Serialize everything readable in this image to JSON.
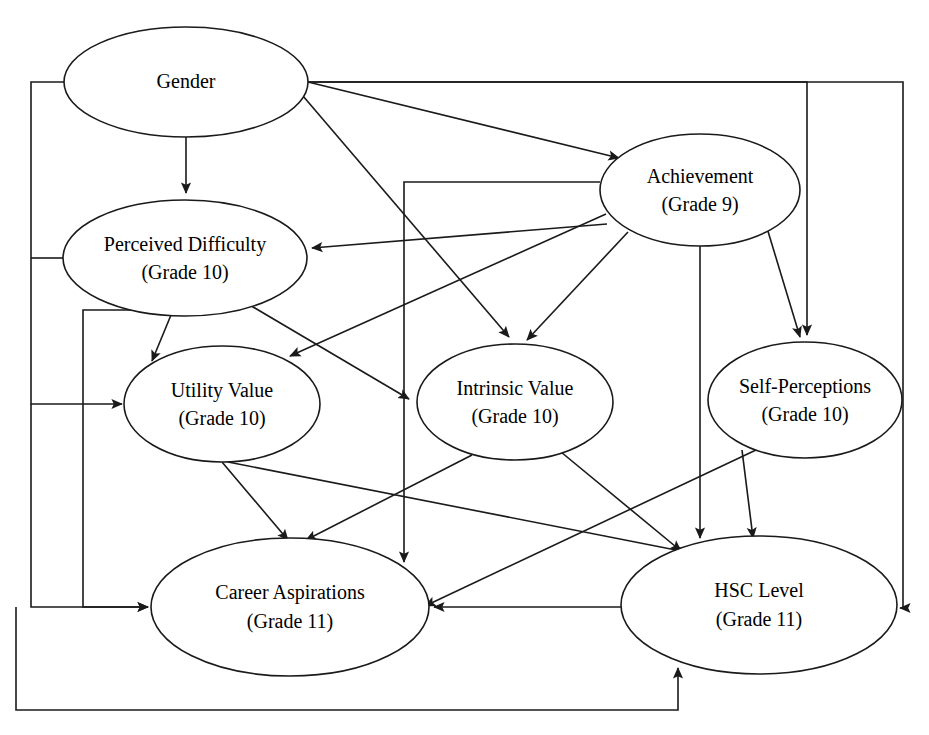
{
  "diagram": {
    "type": "path-diagram",
    "width": 929,
    "height": 735,
    "background_color": "#ffffff",
    "line_color": "#1a1a1a",
    "text_color": "#000000",
    "nodes": [
      {
        "id": "gender",
        "label": "Gender",
        "sublabel": "",
        "cx": 186,
        "cy": 82,
        "rx": 122,
        "ry": 55
      },
      {
        "id": "achievement",
        "label": "Achievement",
        "sublabel": "(Grade 9)",
        "cx": 700,
        "cy": 190,
        "rx": 100,
        "ry": 56
      },
      {
        "id": "perceived_difficulty",
        "label": "Perceived Difficulty",
        "sublabel": "(Grade 10)",
        "cx": 185,
        "cy": 258,
        "rx": 122,
        "ry": 58
      },
      {
        "id": "utility_value",
        "label": "Utility Value",
        "sublabel": "(Grade 10)",
        "cx": 222,
        "cy": 404,
        "rx": 98,
        "ry": 58
      },
      {
        "id": "intrinsic_value",
        "label": "Intrinsic Value",
        "sublabel": "(Grade 10)",
        "cx": 515,
        "cy": 402,
        "rx": 98,
        "ry": 58
      },
      {
        "id": "self_perceptions",
        "label": "Self-Perceptions",
        "sublabel": "(Grade 10)",
        "cx": 805,
        "cy": 400,
        "rx": 97,
        "ry": 58
      },
      {
        "id": "career_aspirations",
        "label": "Career Aspirations",
        "sublabel": "(Grade 11)",
        "cx": 290,
        "cy": 607,
        "rx": 139,
        "ry": 69
      },
      {
        "id": "hsc_level",
        "label": "HSC Level",
        "sublabel": "(Grade 11)",
        "cx": 759,
        "cy": 605,
        "rx": 138,
        "ry": 69
      }
    ],
    "edges": [
      {
        "id": "gender-to-achievement",
        "from": "gender",
        "to": "achievement"
      },
      {
        "id": "gender-to-perceived-difficulty",
        "from": "gender",
        "to": "perceived_difficulty"
      },
      {
        "id": "gender-to-intrinsic-value",
        "from": "gender",
        "to": "intrinsic_value"
      },
      {
        "id": "gender-to-self-perceptions",
        "from": "gender",
        "to": "self_perceptions"
      },
      {
        "id": "gender-to-hsc-level",
        "from": "gender",
        "to": "hsc_level"
      },
      {
        "id": "gender-to-utility-value",
        "from": "gender",
        "to": "utility_value"
      },
      {
        "id": "gender-to-career-aspirations",
        "from": "gender",
        "to": "career_aspirations"
      },
      {
        "id": "achievement-to-perceived-difficulty",
        "from": "achievement",
        "to": "perceived_difficulty"
      },
      {
        "id": "achievement-to-utility-value",
        "from": "achievement",
        "to": "utility_value"
      },
      {
        "id": "achievement-to-intrinsic-value",
        "from": "achievement",
        "to": "intrinsic_value"
      },
      {
        "id": "achievement-to-self-perceptions",
        "from": "achievement",
        "to": "self_perceptions"
      },
      {
        "id": "achievement-to-hsc-level",
        "from": "achievement",
        "to": "hsc_level"
      },
      {
        "id": "achievement-to-career-aspirations",
        "from": "achievement",
        "to": "career_aspirations"
      },
      {
        "id": "perceived-difficulty-to-utility-value",
        "from": "perceived_difficulty",
        "to": "utility_value"
      },
      {
        "id": "perceived-difficulty-to-intrinsic-value",
        "from": "perceived_difficulty",
        "to": "intrinsic_value"
      },
      {
        "id": "perceived-difficulty-to-career-aspirations",
        "from": "perceived_difficulty",
        "to": "career_aspirations"
      },
      {
        "id": "utility-value-to-career-aspirations",
        "from": "utility_value",
        "to": "career_aspirations"
      },
      {
        "id": "utility-value-to-hsc-level",
        "from": "utility_value",
        "to": "hsc_level"
      },
      {
        "id": "intrinsic-value-to-career-aspirations",
        "from": "intrinsic_value",
        "to": "career_aspirations"
      },
      {
        "id": "intrinsic-value-to-hsc-level",
        "from": "intrinsic_value",
        "to": "hsc_level"
      },
      {
        "id": "self-perceptions-to-career-aspirations",
        "from": "self_perceptions",
        "to": "career_aspirations"
      },
      {
        "id": "self-perceptions-to-hsc-level",
        "from": "self_perceptions",
        "to": "hsc_level"
      },
      {
        "id": "hsc-level-to-career-aspirations",
        "from": "hsc_level",
        "to": "career_aspirations"
      },
      {
        "id": "career-aspirations-to-hsc-level",
        "from": "career_aspirations",
        "to": "hsc_level"
      }
    ]
  }
}
